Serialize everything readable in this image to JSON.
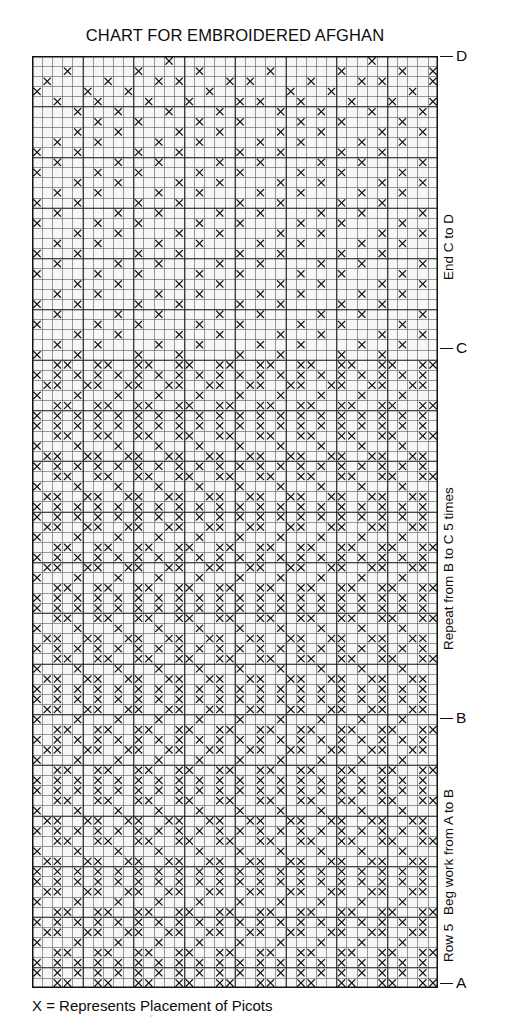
{
  "title": "CHART FOR EMBROIDERED AFGHAN",
  "legend": "X = Represents Placement of Picots",
  "markers": [
    {
      "letter": "D",
      "label_name": "marker-d",
      "top_px": 56
    },
    {
      "letter": "C",
      "label_name": "marker-c",
      "top_px": 348
    },
    {
      "letter": "B",
      "label_name": "marker-b",
      "top_px": 718
    },
    {
      "letter": "A",
      "label_name": "marker-a",
      "top_px": 983
    }
  ],
  "side_labels": [
    {
      "text": "End C to D",
      "name": "label-end-c-to-d",
      "top_px": 280
    },
    {
      "text": "Repeat from B to C 5 times",
      "name": "label-repeat-b-to-c",
      "top_px": 650
    },
    {
      "text": "Beg work from A to B",
      "name": "label-beg-work-a-to-b",
      "top_px": 915
    },
    {
      "text": "Row 5",
      "name": "label-row-5",
      "top_px": 962
    }
  ],
  "chart_data": {
    "type": "heatmap",
    "title": "CHART FOR EMBROIDERED AFGHAN",
    "xlabel": "",
    "ylabel": "",
    "legend_entries": [
      "X = Represents Placement of Picots"
    ],
    "grid": true,
    "cols": 40,
    "rows": 92,
    "cell_px": 10.15,
    "heavy_line_every_cols": 5,
    "heavy_line_every_rows": 5,
    "symbol": "X",
    "symbol_color": "#111111",
    "grid_line_color": "#3a3a3a",
    "heavy_line_color": "#111111",
    "background_color": "#f7f7f5",
    "axis_ranges": {
      "x": [
        0,
        40
      ],
      "y": [
        0,
        92
      ]
    },
    "section_rows": {
      "D_row": 0,
      "C_row": 29,
      "B_row": 65,
      "A_row": 92
    },
    "motif_description": "Repeating chevron/diamond lattice of single X stitches; large V motifs on a 20-column horizontal repeat with 36-row vertical repeat between B and C.",
    "motif_repeat": {
      "cols": 20,
      "rows": 36
    },
    "cells": [
      [
        13,
        0
      ],
      [
        33,
        0
      ],
      [
        3,
        1
      ],
      [
        10,
        1
      ],
      [
        16,
        1
      ],
      [
        23,
        1
      ],
      [
        30,
        1
      ],
      [
        36,
        1
      ],
      [
        39,
        1
      ],
      [
        1,
        2
      ],
      [
        7,
        2
      ],
      [
        12,
        2
      ],
      [
        14,
        2
      ],
      [
        19,
        2
      ],
      [
        21,
        2
      ],
      [
        27,
        2
      ],
      [
        32,
        2
      ],
      [
        34,
        2
      ],
      [
        39,
        2
      ],
      [
        0,
        3
      ],
      [
        5,
        3
      ],
      [
        9,
        3
      ],
      [
        17,
        3
      ],
      [
        25,
        3
      ],
      [
        29,
        3
      ],
      [
        37,
        3
      ],
      [
        2,
        4
      ],
      [
        6,
        4
      ],
      [
        11,
        4
      ],
      [
        15,
        4
      ],
      [
        20,
        4
      ],
      [
        22,
        4
      ],
      [
        26,
        4
      ],
      [
        31,
        4
      ],
      [
        35,
        4
      ],
      [
        39,
        4
      ],
      [
        4,
        5
      ],
      [
        8,
        5
      ],
      [
        13,
        5
      ],
      [
        18,
        5
      ],
      [
        24,
        5
      ],
      [
        28,
        5
      ],
      [
        33,
        5
      ],
      [
        38,
        5
      ],
      [
        6,
        6
      ],
      [
        10,
        6
      ],
      [
        16,
        6
      ],
      [
        20,
        6
      ],
      [
        26,
        6
      ],
      [
        30,
        6
      ],
      [
        36,
        6
      ],
      [
        4,
        7
      ],
      [
        8,
        7
      ],
      [
        14,
        7
      ],
      [
        18,
        7
      ],
      [
        24,
        7
      ],
      [
        28,
        7
      ],
      [
        34,
        7
      ],
      [
        38,
        7
      ],
      [
        2,
        8
      ],
      [
        6,
        8
      ],
      [
        12,
        8
      ],
      [
        16,
        8
      ],
      [
        22,
        8
      ],
      [
        26,
        8
      ],
      [
        32,
        8
      ],
      [
        36,
        8
      ],
      [
        0,
        9
      ],
      [
        4,
        9
      ],
      [
        10,
        9
      ],
      [
        14,
        9
      ],
      [
        20,
        9
      ],
      [
        24,
        9
      ],
      [
        30,
        9
      ],
      [
        34,
        9
      ],
      [
        2,
        10
      ],
      [
        8,
        10
      ],
      [
        12,
        10
      ],
      [
        18,
        10
      ],
      [
        22,
        10
      ],
      [
        28,
        10
      ],
      [
        32,
        10
      ],
      [
        38,
        10
      ],
      [
        0,
        11
      ],
      [
        6,
        11
      ],
      [
        10,
        11
      ],
      [
        16,
        11
      ],
      [
        20,
        11
      ],
      [
        26,
        11
      ],
      [
        30,
        11
      ],
      [
        36,
        11
      ],
      [
        4,
        12
      ],
      [
        8,
        12
      ],
      [
        14,
        12
      ],
      [
        18,
        12
      ],
      [
        24,
        12
      ],
      [
        28,
        12
      ],
      [
        34,
        12
      ],
      [
        38,
        12
      ],
      [
        2,
        13
      ],
      [
        6,
        13
      ],
      [
        12,
        13
      ],
      [
        16,
        13
      ],
      [
        22,
        13
      ],
      [
        26,
        13
      ],
      [
        32,
        13
      ],
      [
        36,
        13
      ],
      [
        0,
        14
      ],
      [
        4,
        14
      ],
      [
        10,
        14
      ],
      [
        14,
        14
      ],
      [
        20,
        14
      ],
      [
        24,
        14
      ],
      [
        30,
        14
      ],
      [
        34,
        14
      ],
      [
        2,
        15
      ],
      [
        8,
        15
      ],
      [
        12,
        15
      ],
      [
        18,
        15
      ],
      [
        22,
        15
      ],
      [
        28,
        15
      ],
      [
        32,
        15
      ],
      [
        38,
        15
      ],
      [
        0,
        16
      ],
      [
        6,
        16
      ],
      [
        10,
        16
      ],
      [
        16,
        16
      ],
      [
        20,
        16
      ],
      [
        26,
        16
      ],
      [
        30,
        16
      ],
      [
        36,
        16
      ],
      [
        4,
        17
      ],
      [
        8,
        17
      ],
      [
        14,
        17
      ],
      [
        18,
        17
      ],
      [
        24,
        17
      ],
      [
        28,
        17
      ],
      [
        34,
        17
      ],
      [
        38,
        17
      ],
      [
        2,
        18
      ],
      [
        6,
        18
      ],
      [
        12,
        18
      ],
      [
        16,
        18
      ],
      [
        22,
        18
      ],
      [
        26,
        18
      ],
      [
        32,
        18
      ],
      [
        36,
        18
      ],
      [
        0,
        19
      ],
      [
        4,
        19
      ],
      [
        10,
        19
      ],
      [
        14,
        19
      ],
      [
        20,
        19
      ],
      [
        24,
        19
      ],
      [
        30,
        19
      ],
      [
        34,
        19
      ],
      [
        2,
        20
      ],
      [
        8,
        20
      ],
      [
        12,
        20
      ],
      [
        18,
        20
      ],
      [
        22,
        20
      ],
      [
        28,
        20
      ],
      [
        32,
        20
      ],
      [
        38,
        20
      ],
      [
        0,
        21
      ],
      [
        6,
        21
      ],
      [
        10,
        21
      ],
      [
        16,
        21
      ],
      [
        20,
        21
      ],
      [
        26,
        21
      ],
      [
        30,
        21
      ],
      [
        36,
        21
      ],
      [
        4,
        22
      ],
      [
        8,
        22
      ],
      [
        14,
        22
      ],
      [
        18,
        22
      ],
      [
        24,
        22
      ],
      [
        28,
        22
      ],
      [
        34,
        22
      ],
      [
        38,
        22
      ],
      [
        2,
        23
      ],
      [
        6,
        23
      ],
      [
        12,
        23
      ],
      [
        16,
        23
      ],
      [
        22,
        23
      ],
      [
        26,
        23
      ],
      [
        32,
        23
      ],
      [
        36,
        23
      ],
      [
        0,
        24
      ],
      [
        4,
        24
      ],
      [
        10,
        24
      ],
      [
        14,
        24
      ],
      [
        20,
        24
      ],
      [
        24,
        24
      ],
      [
        30,
        24
      ],
      [
        34,
        24
      ],
      [
        2,
        25
      ],
      [
        8,
        25
      ],
      [
        12,
        25
      ],
      [
        18,
        25
      ],
      [
        22,
        25
      ],
      [
        28,
        25
      ],
      [
        32,
        25
      ],
      [
        38,
        25
      ],
      [
        0,
        26
      ],
      [
        6,
        26
      ],
      [
        10,
        26
      ],
      [
        16,
        26
      ],
      [
        20,
        26
      ],
      [
        26,
        26
      ],
      [
        30,
        26
      ],
      [
        36,
        26
      ],
      [
        4,
        27
      ],
      [
        8,
        27
      ],
      [
        14,
        27
      ],
      [
        18,
        27
      ],
      [
        24,
        27
      ],
      [
        28,
        27
      ],
      [
        34,
        27
      ],
      [
        38,
        27
      ],
      [
        2,
        28
      ],
      [
        6,
        28
      ],
      [
        12,
        28
      ],
      [
        16,
        28
      ],
      [
        22,
        28
      ],
      [
        26,
        28
      ],
      [
        32,
        28
      ],
      [
        36,
        28
      ],
      [
        0,
        29
      ],
      [
        4,
        29
      ],
      [
        10,
        29
      ],
      [
        14,
        29
      ],
      [
        20,
        29
      ],
      [
        24,
        29
      ],
      [
        30,
        29
      ],
      [
        34,
        29
      ]
    ]
  }
}
